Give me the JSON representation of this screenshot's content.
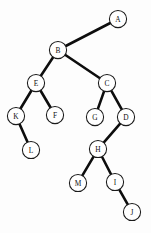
{
  "figure": {
    "type": "binary-tree-diagram",
    "caption": "",
    "background_color": "#fdfdfd",
    "edge_color": "#0d0d0d",
    "node_fill": "#ffffff",
    "node_stroke": "#1a1a1a",
    "node_radius": 8.6,
    "width": 151,
    "height": 233
  },
  "chart_data": {
    "type": "diagram",
    "title": "",
    "nodes": [
      {
        "id": "A",
        "label": "A",
        "x": 118,
        "y": 19
      },
      {
        "id": "B",
        "label": "B",
        "x": 58,
        "y": 50
      },
      {
        "id": "E",
        "label": "E",
        "x": 36,
        "y": 83
      },
      {
        "id": "C",
        "label": "C",
        "x": 107,
        "y": 83
      },
      {
        "id": "K",
        "label": "K",
        "x": 16,
        "y": 116
      },
      {
        "id": "F",
        "label": "F",
        "x": 55,
        "y": 115
      },
      {
        "id": "G",
        "label": "G",
        "x": 95,
        "y": 117
      },
      {
        "id": "D",
        "label": "D",
        "x": 126,
        "y": 117
      },
      {
        "id": "L",
        "label": "L",
        "x": 31,
        "y": 150
      },
      {
        "id": "H",
        "label": "H",
        "x": 98,
        "y": 149
      },
      {
        "id": "M",
        "label": "M",
        "x": 78,
        "y": 183
      },
      {
        "id": "I",
        "label": "I",
        "x": 115,
        "y": 182
      },
      {
        "id": "J",
        "label": "J",
        "x": 132,
        "y": 212
      }
    ],
    "edges": [
      {
        "from": "A",
        "to": "B"
      },
      {
        "from": "B",
        "to": "E"
      },
      {
        "from": "B",
        "to": "C"
      },
      {
        "from": "E",
        "to": "K"
      },
      {
        "from": "E",
        "to": "F"
      },
      {
        "from": "C",
        "to": "G"
      },
      {
        "from": "C",
        "to": "D"
      },
      {
        "from": "K",
        "to": "L"
      },
      {
        "from": "D",
        "to": "H"
      },
      {
        "from": "H",
        "to": "M"
      },
      {
        "from": "H",
        "to": "I"
      },
      {
        "from": "I",
        "to": "J"
      }
    ]
  }
}
